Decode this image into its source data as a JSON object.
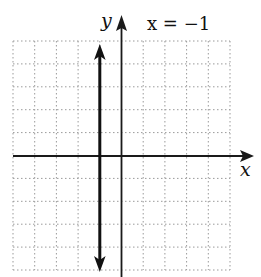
{
  "graph": {
    "equation_label": "x = −1",
    "x_axis_label": "x",
    "y_axis_label": "y",
    "line": {
      "type": "vertical",
      "x": -1
    },
    "grid": {
      "x_min": -5,
      "x_max": 5,
      "y_min": -5,
      "y_max": 5,
      "step": 1,
      "style": "dotted"
    },
    "colors": {
      "background": "#ffffff",
      "axis": "#1a1a1a",
      "grid": "#9a9a9a",
      "line": "#111111"
    }
  }
}
